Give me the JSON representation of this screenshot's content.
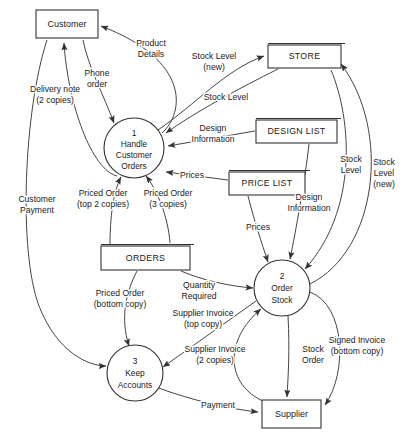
{
  "diagram": {
    "type": "data-flow-diagram",
    "stroke_color": "#333333",
    "flow_color": "#444444",
    "background": "#ffffff"
  },
  "externals": [
    {
      "id": "customer",
      "label": "Customer",
      "x": 36,
      "y": 10,
      "w": 62,
      "h": 28
    },
    {
      "id": "supplier",
      "label": "Supplier",
      "x": 262,
      "y": 400,
      "w": 59,
      "h": 28
    }
  ],
  "datastores": [
    {
      "id": "store",
      "label": "STORE",
      "x": 268,
      "y": 45,
      "w": 73,
      "h": 23
    },
    {
      "id": "design_list",
      "label": "DESIGN LIST",
      "x": 256,
      "y": 120,
      "w": 81,
      "h": 23
    },
    {
      "id": "price_list",
      "label": "PRICE LIST",
      "x": 229,
      "y": 172,
      "w": 76,
      "h": 23
    },
    {
      "id": "orders",
      "label": "ORDERS",
      "x": 101,
      "y": 246,
      "w": 89,
      "h": 24
    }
  ],
  "processes": [
    {
      "id": "p1",
      "number": "1",
      "line1": "Handle",
      "line2": "Customer",
      "line3": "Orders",
      "cx": 134,
      "cy": 148,
      "r": 30
    },
    {
      "id": "p2",
      "number": "2",
      "line1": "Order",
      "line2": "Stock",
      "line3": "",
      "cx": 282,
      "cy": 288,
      "r": 28
    },
    {
      "id": "p3",
      "number": "3",
      "line1": "Keep",
      "line2": "Accounts",
      "line3": "",
      "cx": 135,
      "cy": 373,
      "r": 28
    }
  ],
  "flow_labels": [
    {
      "id": "product-details",
      "lines": [
        "Product",
        "Details"
      ],
      "x": 151,
      "y": 49,
      "anchor": "middle"
    },
    {
      "id": "phone-order",
      "lines": [
        "Phone",
        "order"
      ],
      "x": 97,
      "y": 79,
      "anchor": "middle"
    },
    {
      "id": "delivery-note",
      "lines": [
        "Delivery note",
        "(2 copies)"
      ],
      "x": 55,
      "y": 95,
      "anchor": "middle"
    },
    {
      "id": "customer-payment",
      "lines": [
        "Customer",
        "Payment"
      ],
      "x": 37,
      "y": 205,
      "anchor": "middle"
    },
    {
      "id": "stock-level-new-top",
      "lines": [
        "Stock Level",
        "(new)"
      ],
      "x": 214,
      "y": 62,
      "anchor": "middle"
    },
    {
      "id": "stock-level-top",
      "lines": [
        "Stock Level"
      ],
      "x": 226,
      "y": 98,
      "anchor": "middle"
    },
    {
      "id": "design-information-1",
      "lines": [
        "Design",
        "Information"
      ],
      "x": 213,
      "y": 134,
      "anchor": "middle"
    },
    {
      "id": "prices-1",
      "lines": [
        "Prices"
      ],
      "x": 192,
      "y": 176,
      "anchor": "middle"
    },
    {
      "id": "priced-order-top2",
      "lines": [
        "Priced Order",
        "(top 2 copies)"
      ],
      "x": 103,
      "y": 199,
      "anchor": "middle"
    },
    {
      "id": "priced-order-3",
      "lines": [
        "Priced Order",
        "(3 copies)"
      ],
      "x": 168,
      "y": 199,
      "anchor": "middle"
    },
    {
      "id": "stock-level-right",
      "lines": [
        "Stock",
        "Level"
      ],
      "x": 351,
      "y": 165,
      "anchor": "middle"
    },
    {
      "id": "stock-level-new-right",
      "lines": [
        "Stock",
        "Level",
        "(new)"
      ],
      "x": 384,
      "y": 174,
      "anchor": "middle"
    },
    {
      "id": "design-information-2",
      "lines": [
        "Design",
        "Information"
      ],
      "x": 309,
      "y": 203,
      "anchor": "middle"
    },
    {
      "id": "prices-2",
      "lines": [
        "Prices"
      ],
      "x": 258,
      "y": 228,
      "anchor": "middle"
    },
    {
      "id": "priced-order-bottom",
      "lines": [
        "Priced Order",
        "(bottom copy)"
      ],
      "x": 120,
      "y": 299,
      "anchor": "middle"
    },
    {
      "id": "quantity-required",
      "lines": [
        "Quantity",
        "Required"
      ],
      "x": 199,
      "y": 291,
      "anchor": "middle"
    },
    {
      "id": "supplier-invoice-top",
      "lines": [
        "Supplier Invoice",
        "(top copy)"
      ],
      "x": 203,
      "y": 319,
      "anchor": "middle"
    },
    {
      "id": "supplier-invoice-2",
      "lines": [
        "Supplier Invoice",
        "(2 copies)"
      ],
      "x": 215,
      "y": 355,
      "anchor": "middle"
    },
    {
      "id": "stock-order",
      "lines": [
        "Stock",
        "Order"
      ],
      "x": 313,
      "y": 355,
      "anchor": "middle"
    },
    {
      "id": "signed-invoice",
      "lines": [
        "Signed Invoice",
        "(bottom copy)"
      ],
      "x": 357,
      "y": 346,
      "anchor": "middle"
    },
    {
      "id": "payment",
      "lines": [
        "Payment"
      ],
      "x": 218,
      "y": 406,
      "anchor": "middle"
    }
  ],
  "flows": [
    {
      "id": "flow-product-details",
      "from": "p1",
      "to": "customer",
      "label": "product-details"
    },
    {
      "id": "flow-phone-order",
      "from": "customer",
      "to": "p1",
      "label": "phone-order"
    },
    {
      "id": "flow-delivery-note",
      "from": "p1",
      "to": "customer",
      "label": "delivery-note"
    },
    {
      "id": "flow-customer-payment",
      "from": "customer",
      "to": "p3",
      "label": "customer-payment"
    },
    {
      "id": "flow-stock-level-new-top",
      "from": "p1",
      "to": "store",
      "label": "stock-level-new-top"
    },
    {
      "id": "flow-stock-level-top",
      "from": "store",
      "to": "p1",
      "label": "stock-level-top"
    },
    {
      "id": "flow-design-info-1",
      "from": "design_list",
      "to": "p1",
      "label": "design-information-1"
    },
    {
      "id": "flow-prices-1",
      "from": "price_list",
      "to": "p1",
      "label": "prices-1"
    },
    {
      "id": "flow-priced-order-top2",
      "from": "p1",
      "to": "orders",
      "label": "priced-order-top2"
    },
    {
      "id": "flow-priced-order-3",
      "from": "p1",
      "to": "orders",
      "label": "priced-order-3"
    },
    {
      "id": "flow-stock-level-right",
      "from": "store",
      "to": "p2",
      "label": "stock-level-right"
    },
    {
      "id": "flow-stock-level-new-right",
      "from": "p2",
      "to": "store",
      "label": "stock-level-new-right"
    },
    {
      "id": "flow-design-info-2",
      "from": "design_list",
      "to": "p2",
      "label": "design-information-2"
    },
    {
      "id": "flow-prices-2",
      "from": "price_list",
      "to": "p2",
      "label": "prices-2"
    },
    {
      "id": "flow-priced-order-bottom",
      "from": "orders",
      "to": "p3",
      "label": "priced-order-bottom"
    },
    {
      "id": "flow-quantity-required",
      "from": "orders",
      "to": "p2",
      "label": "quantity-required"
    },
    {
      "id": "flow-supplier-invoice-top",
      "from": "p2",
      "to": "p3",
      "label": "supplier-invoice-top"
    },
    {
      "id": "flow-supplier-invoice-2",
      "from": "supplier",
      "to": "p2",
      "label": "supplier-invoice-2"
    },
    {
      "id": "flow-stock-order",
      "from": "p2",
      "to": "supplier",
      "label": "stock-order"
    },
    {
      "id": "flow-signed-invoice",
      "from": "p2",
      "to": "supplier",
      "label": "signed-invoice"
    },
    {
      "id": "flow-payment",
      "from": "p3",
      "to": "supplier",
      "label": "payment"
    }
  ]
}
